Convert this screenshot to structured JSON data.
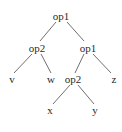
{
  "diagram": {
    "type": "tree",
    "colors": {
      "background": "#ffffff",
      "text": "#2b2b2b",
      "edge": "#4a4a4a"
    },
    "nodes": [
      {
        "id": "n0",
        "label": "op1",
        "x": 61,
        "y": 16
      },
      {
        "id": "n1",
        "label": "op2",
        "x": 37,
        "y": 48
      },
      {
        "id": "n2",
        "label": "op1",
        "x": 88,
        "y": 48
      },
      {
        "id": "n3",
        "label": "v",
        "x": 12,
        "y": 79
      },
      {
        "id": "n4",
        "label": "w",
        "x": 51,
        "y": 79
      },
      {
        "id": "n5",
        "label": "op2",
        "x": 73,
        "y": 79
      },
      {
        "id": "n6",
        "label": "z",
        "x": 114,
        "y": 79
      },
      {
        "id": "n7",
        "label": "x",
        "x": 50,
        "y": 110
      },
      {
        "id": "n8",
        "label": "y",
        "x": 95,
        "y": 110
      }
    ],
    "edges": [
      {
        "from": "n0",
        "to": "n1",
        "x1": 56,
        "y1": 22,
        "x2": 40,
        "y2": 41
      },
      {
        "from": "n0",
        "to": "n2",
        "x1": 67,
        "y1": 22,
        "x2": 84,
        "y2": 41
      },
      {
        "from": "n1",
        "to": "n3",
        "x1": 32,
        "y1": 54,
        "x2": 14,
        "y2": 73
      },
      {
        "from": "n1",
        "to": "n4",
        "x1": 41,
        "y1": 54,
        "x2": 51,
        "y2": 73
      },
      {
        "from": "n2",
        "to": "n5",
        "x1": 84,
        "y1": 54,
        "x2": 75,
        "y2": 73
      },
      {
        "from": "n2",
        "to": "n6",
        "x1": 93,
        "y1": 54,
        "x2": 111,
        "y2": 73
      },
      {
        "from": "n5",
        "to": "n7",
        "x1": 70,
        "y1": 85,
        "x2": 53,
        "y2": 104
      },
      {
        "from": "n5",
        "to": "n8",
        "x1": 78,
        "y1": 85,
        "x2": 94,
        "y2": 104
      }
    ]
  }
}
